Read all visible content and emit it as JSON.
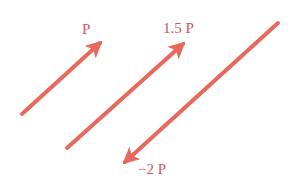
{
  "diagram": {
    "colors": {
      "arrow": "#E8685C",
      "label": "#D4545C",
      "background": "#FFFFFF"
    },
    "vectors": [
      {
        "label": "P",
        "scale": 1,
        "tail": [
          22,
          114
        ],
        "head": [
          100,
          43
        ],
        "label_pos": [
          82,
          22
        ]
      },
      {
        "label": "1.5 P",
        "scale": 1.5,
        "tail": [
          67,
          148
        ],
        "head": [
          183,
          44
        ],
        "label_pos": [
          163,
          21
        ]
      },
      {
        "label": "−2 P",
        "scale": -2,
        "tail": [
          278,
          23
        ],
        "head": [
          125,
          162
        ],
        "label_pos": [
          138,
          162
        ]
      }
    ]
  }
}
